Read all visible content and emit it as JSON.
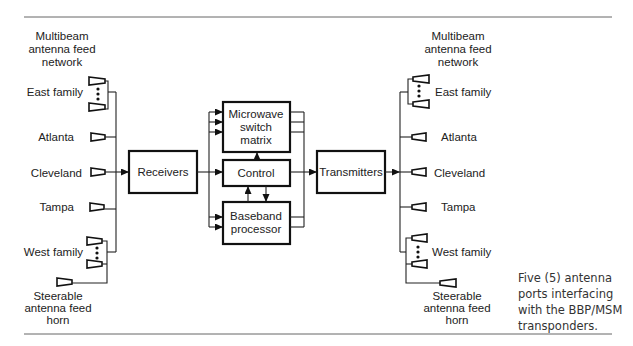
{
  "left_network": {
    "title_lines": [
      "Multibeam",
      "antenna feed",
      "network"
    ],
    "feeds": [
      "East family",
      "Atlanta",
      "Cleveland",
      "Tampa",
      "West family"
    ],
    "steerable_lines": [
      "Steerable",
      "antenna feed",
      "horn"
    ]
  },
  "right_network": {
    "title_lines": [
      "Multibeam",
      "antenna feed",
      "network"
    ],
    "feeds": [
      "East family",
      "Atlanta",
      "Cleveland",
      "Tampa",
      "West family"
    ],
    "steerable_lines": [
      "Steerable",
      "antenna feed",
      "horn"
    ]
  },
  "blocks": {
    "receivers": "Receivers",
    "msm_lines": [
      "Microwave",
      "switch",
      "matrix"
    ],
    "control": "Control",
    "bbp_lines": [
      "Baseband",
      "processor"
    ],
    "transmitters": "Transmitters"
  },
  "caption": "Five (5) antenna ports interfacing with the BBP/MSM transponders."
}
